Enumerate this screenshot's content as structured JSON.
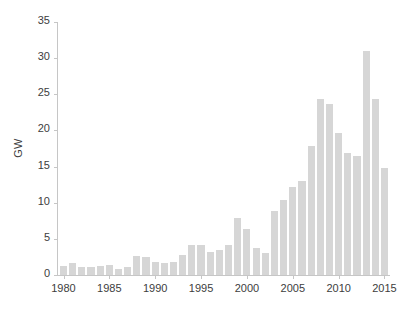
{
  "chart_data": {
    "type": "bar",
    "title": "",
    "xlabel": "",
    "ylabel": "GW",
    "ylim": [
      0,
      35
    ],
    "xlim": [
      1979.4,
      2015.6
    ],
    "ytick_labels": [
      "0",
      "5",
      "10",
      "15",
      "20",
      "25",
      "30",
      "35"
    ],
    "ytick_values": [
      0,
      5,
      10,
      15,
      20,
      25,
      30,
      35
    ],
    "xtick_labels": [
      "1980",
      "1985",
      "1990",
      "1995",
      "2000",
      "2005",
      "2010",
      "2015"
    ],
    "xtick_values": [
      1980,
      1985,
      1990,
      1995,
      2000,
      2005,
      2010,
      2015
    ],
    "grid": false,
    "legend": null,
    "bar_color": "#d6d6d6",
    "axis_color": "#c6c6c6",
    "text_color": "#3d3d3d",
    "categories": [
      1980,
      1981,
      1982,
      1983,
      1984,
      1985,
      1986,
      1987,
      1988,
      1989,
      1990,
      1991,
      1992,
      1993,
      1994,
      1995,
      1996,
      1997,
      1998,
      1999,
      2000,
      2001,
      2002,
      2003,
      2004,
      2005,
      2006,
      2007,
      2008,
      2009,
      2010,
      2011,
      2012,
      2013,
      2014,
      2015
    ],
    "values": [
      1.2,
      1.6,
      1.1,
      1.1,
      1.2,
      1.4,
      0.9,
      1.1,
      2.6,
      2.5,
      1.8,
      1.7,
      1.8,
      2.8,
      4.2,
      4.2,
      3.2,
      3.4,
      4.1,
      7.9,
      6.3,
      3.7,
      3.1,
      8.8,
      10.4,
      12.2,
      13.0,
      17.9,
      24.3,
      23.6,
      19.7,
      16.9,
      16.4,
      31.0,
      24.4,
      14.8
    ]
  }
}
